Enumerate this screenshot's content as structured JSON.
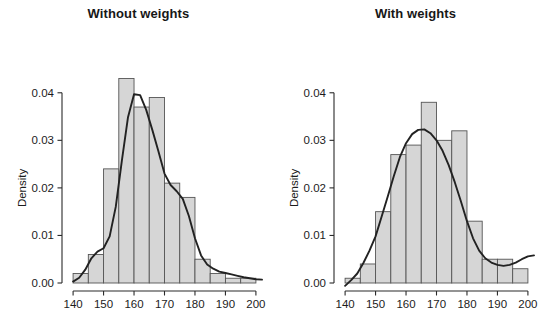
{
  "figure": {
    "panels": [
      {
        "id": "without-weights",
        "title": "Without weights",
        "ylabel": "Density"
      },
      {
        "id": "with-weights",
        "title": "With weights",
        "ylabel": "Density"
      }
    ]
  },
  "chart_data": [
    {
      "type": "bar",
      "title": "Without weights",
      "xlabel": "",
      "ylabel": "Density",
      "xlim": [
        138,
        202
      ],
      "ylim": [
        0.0,
        0.045
      ],
      "xticks": [
        140,
        150,
        160,
        170,
        180,
        190,
        200
      ],
      "xticklabels": [
        "140",
        "150",
        "160",
        "170",
        "180",
        "190",
        "200"
      ],
      "yticks": [
        0.0,
        0.01,
        0.02,
        0.03,
        0.04
      ],
      "yticklabels": [
        "0.00",
        "0.01",
        "0.02",
        "0.03",
        "0.04"
      ],
      "grid": false,
      "legend": null,
      "bin_edges": [
        140,
        145,
        150,
        155,
        160,
        165,
        170,
        175,
        180,
        185,
        190,
        195,
        200
      ],
      "categories": [
        "140-145",
        "145-150",
        "150-155",
        "155-160",
        "160-165",
        "165-170",
        "170-175",
        "175-180",
        "180-185",
        "185-190",
        "190-195",
        "195-200"
      ],
      "values": [
        0.002,
        0.006,
        0.024,
        0.043,
        0.037,
        0.039,
        0.021,
        0.018,
        0.005,
        0.002,
        0.001,
        0.001
      ],
      "overlay": {
        "name": "density-curve",
        "type": "line",
        "x": [
          140,
          142,
          144,
          146,
          148,
          150,
          152,
          154,
          156,
          158,
          160,
          162,
          164,
          166,
          168,
          170,
          172,
          174,
          176,
          178,
          180,
          182,
          184,
          186,
          188,
          190,
          192,
          194,
          196,
          198,
          200,
          202
        ],
        "y": [
          0.0003,
          0.0011,
          0.0028,
          0.0052,
          0.0066,
          0.0073,
          0.0098,
          0.016,
          0.0257,
          0.0348,
          0.0397,
          0.0395,
          0.0364,
          0.0322,
          0.0277,
          0.023,
          0.0206,
          0.0193,
          0.0177,
          0.0141,
          0.0094,
          0.0058,
          0.0039,
          0.003,
          0.0024,
          0.0021,
          0.0018,
          0.0015,
          0.0012,
          0.001,
          0.0008,
          0.0007
        ]
      }
    },
    {
      "type": "bar",
      "title": "With weights",
      "xlabel": "",
      "ylabel": "Density",
      "xlim": [
        138,
        202
      ],
      "ylim": [
        0.0,
        0.045
      ],
      "xticks": [
        140,
        150,
        160,
        170,
        180,
        190,
        200
      ],
      "xticklabels": [
        "140",
        "150",
        "160",
        "170",
        "180",
        "190",
        "200"
      ],
      "yticks": [
        0.0,
        0.01,
        0.02,
        0.03,
        0.04
      ],
      "yticklabels": [
        "0.00",
        "0.01",
        "0.02",
        "0.03",
        "0.04"
      ],
      "grid": false,
      "legend": null,
      "bin_edges": [
        140,
        145,
        150,
        155,
        160,
        165,
        170,
        175,
        180,
        185,
        190,
        195,
        200
      ],
      "categories": [
        "140-145",
        "145-150",
        "150-155",
        "155-160",
        "160-165",
        "165-170",
        "170-175",
        "175-180",
        "180-185",
        "185-190",
        "190-195",
        "195-200"
      ],
      "values": [
        0.001,
        0.004,
        0.015,
        0.027,
        0.029,
        0.038,
        0.03,
        0.032,
        0.013,
        0.005,
        0.005,
        0.003
      ],
      "overlay": {
        "name": "density-curve",
        "type": "line",
        "x": [
          140,
          142,
          144,
          146,
          148,
          150,
          152,
          154,
          156,
          158,
          160,
          162,
          164,
          166,
          168,
          170,
          172,
          174,
          176,
          178,
          180,
          182,
          184,
          186,
          188,
          190,
          192,
          194,
          196,
          198,
          200,
          202
        ],
        "y": [
          -0.0006,
          0.0006,
          0.002,
          0.0042,
          0.0068,
          0.0098,
          0.014,
          0.0182,
          0.0225,
          0.0265,
          0.0294,
          0.0313,
          0.0322,
          0.0323,
          0.0315,
          0.03,
          0.0278,
          0.0248,
          0.0212,
          0.0172,
          0.013,
          0.0094,
          0.0068,
          0.0052,
          0.0043,
          0.0038,
          0.0036,
          0.0038,
          0.0043,
          0.005,
          0.0056,
          0.0058
        ]
      }
    }
  ]
}
